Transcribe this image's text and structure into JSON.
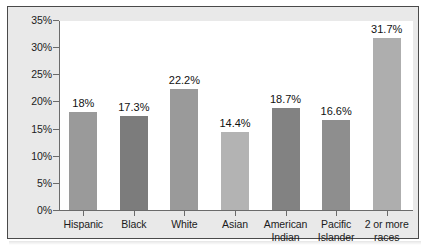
{
  "chart_data": {
    "type": "bar",
    "title": "",
    "subtitle": "",
    "xlabel": "",
    "ylabel": "",
    "categories": [
      "Hispanic",
      "Black",
      "White",
      "Asian",
      "American Indian",
      "Pacific Islander",
      "2 or more races"
    ],
    "category_lines": [
      [
        "Hispanic",
        ""
      ],
      [
        "Black",
        ""
      ],
      [
        "White",
        ""
      ],
      [
        "Asian",
        ""
      ],
      [
        "American",
        "Indian"
      ],
      [
        "Pacific",
        "Islander"
      ],
      [
        "2 or more",
        "races"
      ]
    ],
    "values": [
      18,
      17.3,
      22.2,
      14.4,
      18.7,
      16.6,
      31.7
    ],
    "value_labels": [
      "18%",
      "17.3%",
      "22.2%",
      "14.4%",
      "18.7%",
      "16.6%",
      "31.7%"
    ],
    "bar_colors": [
      "#9a9a9a",
      "#7c7c7c",
      "#9a9a9a",
      "#b3b3b3",
      "#828282",
      "#8e8e8e",
      "#aeaeae"
    ],
    "ylim": [
      0,
      35
    ],
    "ytick_values": [
      0,
      5,
      10,
      15,
      20,
      25,
      30,
      35
    ],
    "ytick_labels": [
      "0%",
      "5%",
      "10%",
      "15%",
      "20%",
      "25%",
      "30%",
      "35%"
    ],
    "grid": false,
    "legend": false,
    "legend_position": "none",
    "axis_color": "#6b6b6b",
    "plot_background": "#ffffff",
    "figure_background": "#e9e9e9",
    "frame_color": "#4a4a4a"
  }
}
